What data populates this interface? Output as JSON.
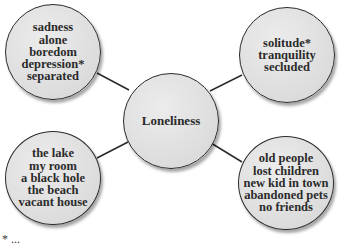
{
  "diagram": {
    "type": "concept-web",
    "center": {
      "label": "Loneliness"
    },
    "nodes": [
      {
        "position": "top-left",
        "lines": [
          "sadness",
          "alone",
          "boredom",
          "depression*",
          "separated"
        ]
      },
      {
        "position": "top-right",
        "lines": [
          "solitude*",
          "tranquility",
          "secluded"
        ]
      },
      {
        "position": "bottom-left",
        "lines": [
          "the lake",
          "my room",
          "a black hole",
          "the beach",
          "vacant house"
        ]
      },
      {
        "position": "bottom-right",
        "lines": [
          "old people",
          "lost children",
          "new kid in town",
          "abandoned pets",
          "no friends"
        ]
      }
    ],
    "footnote": "* ..."
  },
  "colors": {
    "bubble_fill": "#dcdcdc",
    "bubble_border": "#2a2a2a",
    "connector": "#2a2a2a",
    "text": "#2b2b2b",
    "background": "#ffffff"
  }
}
